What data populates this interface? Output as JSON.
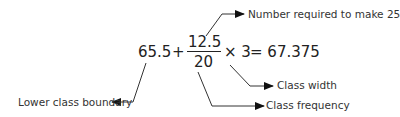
{
  "equation": {
    "lower_boundary": "65.5",
    "plus": "+",
    "numerator": "12.5",
    "denominator": "20",
    "times": "× 3",
    "equals": "= 67.375"
  },
  "annotations": {
    "numerator": "Number required to make 25",
    "lower_boundary": "Lower class boundary",
    "class_width": "Class width",
    "class_frequency": "Class frequency"
  }
}
